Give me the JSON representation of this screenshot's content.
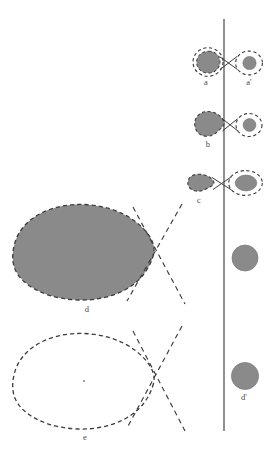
{
  "figure": {
    "type": "scientific-diagram",
    "background_color": "#ffffff",
    "fill_color": "#8a8a8a",
    "stroke_color": "#3c3c3c",
    "label_color": "#4a4a4a",
    "line_color": "#55555a"
  },
  "reference_line": {
    "name": "vertical-reference-line",
    "x": 224,
    "y_top": 19,
    "y_bottom": 431,
    "color": "#55555a",
    "width": 1.2
  },
  "labels": [
    {
      "id": "a",
      "text": "a",
      "x": 206,
      "y": 78
    },
    {
      "id": "ap",
      "text": "a'",
      "x": 248,
      "y": 78
    },
    {
      "id": "b",
      "text": "b",
      "x": 208,
      "y": 140
    },
    {
      "id": "c",
      "text": "c",
      "x": 200,
      "y": 197
    },
    {
      "id": "d",
      "text": "d",
      "x": 87,
      "y": 305
    },
    {
      "id": "e",
      "text": "e",
      "x": 85,
      "y": 434
    },
    {
      "id": "dp",
      "text": "d'",
      "x": 243,
      "y": 394
    }
  ],
  "objects": [
    {
      "name": "body-a-left",
      "kind": "filled-blob-with-dashed-halo",
      "cx": 208,
      "cy": 62,
      "rx": 11.5,
      "ry": 11,
      "halo_rx": 15,
      "halo_ry": 14.5,
      "fill": "#8a8a8a"
    },
    {
      "name": "body-a-right",
      "kind": "filled-disc-with-dashed-halo",
      "cx": 249,
      "cy": 63,
      "rx": 6.5,
      "ry": 6.5,
      "halo_rx": 13.5,
      "halo_ry": 12,
      "fill": "#8a8a8a"
    },
    {
      "name": "body-b-left",
      "kind": "filled-teardrop-with-dashed-outline",
      "cx": 208,
      "cy": 124,
      "rx": 13,
      "ry": 12,
      "fill": "#8a8a8a"
    },
    {
      "name": "body-b-right",
      "kind": "filled-disc-with-dashed-halo",
      "cx": 249,
      "cy": 125,
      "rx": 6.5,
      "ry": 6.5,
      "halo_rx": 13,
      "halo_ry": 11.5,
      "fill": "#8a8a8a"
    },
    {
      "name": "body-c-left",
      "kind": "filled-teardrop",
      "cx": 200,
      "cy": 183,
      "rx": 12,
      "ry": 8.5,
      "fill": "#8a8a8a"
    },
    {
      "name": "body-c-right",
      "kind": "filled-ellipse-with-dashed-halo",
      "cx": 245,
      "cy": 183,
      "rx": 11,
      "ry": 8,
      "halo_rx": 17,
      "halo_ry": 12.5,
      "fill": "#8a8a8a"
    },
    {
      "name": "body-d",
      "kind": "large-filled-lens-with-dashed-outline",
      "cx": 84,
      "cy": 253,
      "rx": 69,
      "ry": 47,
      "fill": "#8a8a8a"
    },
    {
      "name": "body-e",
      "kind": "large-unfilled-lens-with-dashed-outline",
      "cx": 84,
      "cy": 382,
      "rx": 69,
      "ry": 47,
      "fill": "none",
      "center_dot": true
    },
    {
      "name": "body-right-middle",
      "kind": "filled-disc",
      "cx": 245,
      "cy": 258,
      "rx": 13,
      "ry": 13,
      "fill": "#8a8a8a"
    },
    {
      "name": "body-d-prime",
      "kind": "filled-disc",
      "cx": 245,
      "cy": 376,
      "rx": 13.5,
      "ry": 13.5,
      "fill": "#8a8a8a"
    }
  ],
  "spindle_lines": [
    {
      "name": "spindle-d-upper",
      "x1": 181,
      "y1": 205,
      "x2": 128,
      "y2": 300
    },
    {
      "name": "spindle-d-lower",
      "x1": 134,
      "y1": 208,
      "x2": 184,
      "y2": 303
    },
    {
      "name": "spindle-e-upper",
      "x1": 181,
      "y1": 327,
      "x2": 128,
      "y2": 428
    },
    {
      "name": "spindle-e-lower",
      "x1": 134,
      "y1": 332,
      "x2": 184,
      "y2": 430
    }
  ],
  "caption": {
    "text": "",
    "visible": false,
    "note": "bottom caption line is cropped; only faint letter tops are visible"
  }
}
